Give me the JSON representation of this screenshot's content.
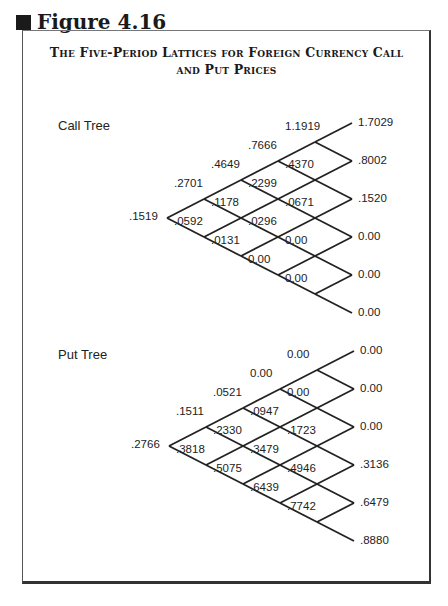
{
  "figure": {
    "title": "Figure 4.16",
    "subtitle_line1": "The Five-Period Lattices for Foreign Currency Call",
    "subtitle_line2": "and Put Prices"
  },
  "call_tree": {
    "label": "Call Tree",
    "levels": [
      [
        ".1519"
      ],
      [
        ".2701",
        ".0592"
      ],
      [
        ".4649",
        ".1178",
        ".0131"
      ],
      [
        ".7666",
        ".2299",
        ".0296",
        "0.00"
      ],
      [
        "1.1919",
        ".4370",
        ".0671",
        "0.00",
        "0.00"
      ],
      [
        "1.7029",
        ".8002",
        ".1520",
        "0.00",
        "0.00",
        "0.00"
      ]
    ]
  },
  "put_tree": {
    "label": "Put Tree",
    "levels": [
      [
        ".2766"
      ],
      [
        ".1511",
        ".3818"
      ],
      [
        ".0521",
        ".2330",
        ".5075"
      ],
      [
        "0.00",
        ".0947",
        ".3479",
        ".6439"
      ],
      [
        "0.00",
        "0.00",
        ".1723",
        ".4946",
        ".7742"
      ],
      [
        "0.00",
        "0.00",
        "0.00",
        ".3136",
        ".6479",
        ".8880"
      ]
    ]
  },
  "colors": {
    "line": "#222222",
    "text": "#222222",
    "background": "#ffffff"
  }
}
